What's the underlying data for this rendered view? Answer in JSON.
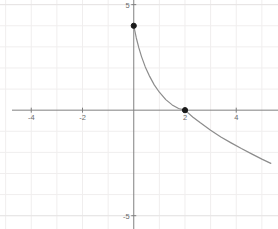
{
  "chart_data": {
    "type": "line",
    "title": "",
    "xlabel": "",
    "ylabel": "",
    "xlim": [
      -5.22,
      5.63
    ],
    "ylim": [
      -5.63,
      5.22
    ],
    "grid": true,
    "legend": null,
    "axis_color": "#808080",
    "grid_color": "#f0eeee",
    "curve_color": "#8c8c8c",
    "point_color": "#1a1a1a",
    "background_color": "#ffffff",
    "xticks": [
      -4,
      -2,
      2,
      4
    ],
    "xtick_labels": [
      "-4",
      "-2",
      "2",
      "4"
    ],
    "yticks": [
      5,
      -5
    ],
    "ytick_labels": [
      "5",
      "-5"
    ],
    "series": [
      {
        "name": "decaying-curve",
        "comment": "decreasing curve from (0,4) through (2,0) to lower right",
        "x": [
          0.0,
          0.1,
          0.2,
          0.3,
          0.45,
          0.6,
          0.8,
          1.0,
          1.25,
          1.5,
          1.75,
          2.0,
          2.3,
          2.6,
          3.0,
          3.4,
          3.8,
          4.2,
          4.6,
          5.0,
          5.35
        ],
        "y": [
          4.0,
          3.42,
          2.95,
          2.55,
          2.05,
          1.65,
          1.2,
          0.85,
          0.5,
          0.25,
          0.08,
          0.0,
          -0.32,
          -0.6,
          -0.95,
          -1.27,
          -1.55,
          -1.82,
          -2.07,
          -2.32,
          -2.52
        ]
      }
    ],
    "points": [
      {
        "label": "y-intercept",
        "x": 0,
        "y": 4,
        "filled": true
      },
      {
        "label": "x-intercept",
        "x": 2,
        "y": 0,
        "filled": true
      }
    ]
  }
}
